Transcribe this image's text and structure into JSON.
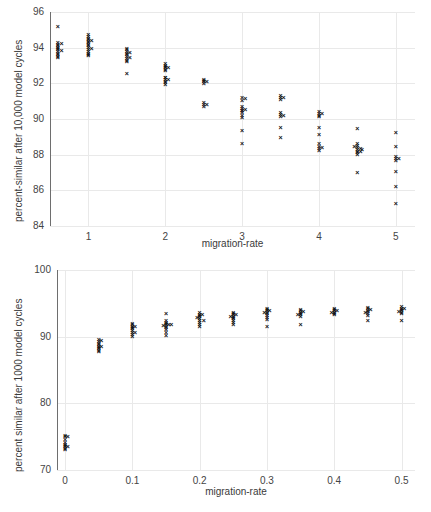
{
  "figure": {
    "background": "#ffffff",
    "marker_color": "#111111",
    "grid_color": "#e9e9e9",
    "axis_color": "#6e6e6e"
  },
  "chart_data": [
    {
      "id": "top",
      "type": "scatter",
      "title": "",
      "xlabel": "migration-rate",
      "ylabel": "percent-similar after 10,000 model cycles",
      "xlim": [
        0.5,
        5.25
      ],
      "ylim": [
        84,
        96
      ],
      "xticks": [
        1,
        2,
        3,
        4,
        5
      ],
      "xticklabels": [
        "1",
        "2",
        "3",
        "4",
        "5"
      ],
      "yticks": [
        84,
        86,
        88,
        90,
        92,
        94,
        96
      ],
      "yticklabels": [
        "84",
        "86",
        "88",
        "90",
        "92",
        "94",
        "96"
      ],
      "grid": true,
      "legend": "none",
      "points": [
        {
          "x": 0.6,
          "y": 95.2
        },
        {
          "x": 0.6,
          "y": 94.3
        },
        {
          "x": 0.6,
          "y": 94.2
        },
        {
          "x": 0.6,
          "y": 94.1
        },
        {
          "x": 0.6,
          "y": 94.0
        },
        {
          "x": 0.6,
          "y": 93.95
        },
        {
          "x": 0.6,
          "y": 93.9
        },
        {
          "x": 0.6,
          "y": 93.8
        },
        {
          "x": 0.6,
          "y": 93.7
        },
        {
          "x": 0.6,
          "y": 93.6
        },
        {
          "x": 0.6,
          "y": 93.5
        },
        {
          "x": 0.6,
          "y": 93.45
        },
        {
          "x": 0.65,
          "y": 94.25
        },
        {
          "x": 0.65,
          "y": 93.85
        },
        {
          "x": 1.0,
          "y": 94.75
        },
        {
          "x": 1.0,
          "y": 94.6
        },
        {
          "x": 1.0,
          "y": 94.5
        },
        {
          "x": 1.0,
          "y": 94.45
        },
        {
          "x": 1.0,
          "y": 94.35
        },
        {
          "x": 1.0,
          "y": 94.3
        },
        {
          "x": 1.0,
          "y": 94.2
        },
        {
          "x": 1.0,
          "y": 94.1
        },
        {
          "x": 1.0,
          "y": 94.0
        },
        {
          "x": 1.0,
          "y": 93.9
        },
        {
          "x": 1.0,
          "y": 93.8
        },
        {
          "x": 1.0,
          "y": 93.7
        },
        {
          "x": 1.0,
          "y": 93.6
        },
        {
          "x": 1.0,
          "y": 93.55
        },
        {
          "x": 1.04,
          "y": 94.4
        },
        {
          "x": 1.04,
          "y": 93.95
        },
        {
          "x": 1.5,
          "y": 93.95
        },
        {
          "x": 1.5,
          "y": 93.9
        },
        {
          "x": 1.5,
          "y": 93.8
        },
        {
          "x": 1.5,
          "y": 93.7
        },
        {
          "x": 1.5,
          "y": 93.6
        },
        {
          "x": 1.5,
          "y": 93.5
        },
        {
          "x": 1.5,
          "y": 93.4
        },
        {
          "x": 1.5,
          "y": 93.3
        },
        {
          "x": 1.5,
          "y": 93.25
        },
        {
          "x": 1.54,
          "y": 93.75
        },
        {
          "x": 1.54,
          "y": 93.45
        },
        {
          "x": 1.5,
          "y": 92.55
        },
        {
          "x": 2.0,
          "y": 93.1
        },
        {
          "x": 2.0,
          "y": 93.0
        },
        {
          "x": 2.0,
          "y": 92.95
        },
        {
          "x": 2.0,
          "y": 92.9
        },
        {
          "x": 2.0,
          "y": 92.8
        },
        {
          "x": 2.0,
          "y": 92.7
        },
        {
          "x": 2.0,
          "y": 92.35
        },
        {
          "x": 2.0,
          "y": 92.3
        },
        {
          "x": 2.0,
          "y": 92.2
        },
        {
          "x": 2.0,
          "y": 92.1
        },
        {
          "x": 2.0,
          "y": 92.05
        },
        {
          "x": 2.0,
          "y": 91.95
        },
        {
          "x": 2.04,
          "y": 92.9
        },
        {
          "x": 2.04,
          "y": 92.2
        },
        {
          "x": 2.5,
          "y": 92.2
        },
        {
          "x": 2.5,
          "y": 92.15
        },
        {
          "x": 2.5,
          "y": 92.1
        },
        {
          "x": 2.5,
          "y": 92.0
        },
        {
          "x": 2.54,
          "y": 92.1
        },
        {
          "x": 2.5,
          "y": 90.9
        },
        {
          "x": 2.5,
          "y": 90.8
        },
        {
          "x": 2.5,
          "y": 90.7
        },
        {
          "x": 2.54,
          "y": 90.8
        },
        {
          "x": 3.0,
          "y": 91.2
        },
        {
          "x": 3.0,
          "y": 91.05
        },
        {
          "x": 3.0,
          "y": 90.7
        },
        {
          "x": 3.0,
          "y": 90.6
        },
        {
          "x": 3.0,
          "y": 90.5
        },
        {
          "x": 3.0,
          "y": 90.45
        },
        {
          "x": 3.0,
          "y": 90.35
        },
        {
          "x": 3.0,
          "y": 90.2
        },
        {
          "x": 3.0,
          "y": 90.1
        },
        {
          "x": 3.04,
          "y": 90.55
        },
        {
          "x": 3.04,
          "y": 91.15
        },
        {
          "x": 3.0,
          "y": 89.35
        },
        {
          "x": 3.0,
          "y": 88.65
        },
        {
          "x": 3.5,
          "y": 91.3
        },
        {
          "x": 3.5,
          "y": 91.2
        },
        {
          "x": 3.5,
          "y": 91.1
        },
        {
          "x": 3.54,
          "y": 91.2
        },
        {
          "x": 3.5,
          "y": 90.35
        },
        {
          "x": 3.5,
          "y": 90.25
        },
        {
          "x": 3.5,
          "y": 90.15
        },
        {
          "x": 3.54,
          "y": 90.2
        },
        {
          "x": 3.5,
          "y": 89.55
        },
        {
          "x": 3.5,
          "y": 88.95
        },
        {
          "x": 4.0,
          "y": 90.4
        },
        {
          "x": 4.0,
          "y": 90.3
        },
        {
          "x": 4.0,
          "y": 90.2
        },
        {
          "x": 4.0,
          "y": 90.15
        },
        {
          "x": 4.04,
          "y": 90.3
        },
        {
          "x": 4.0,
          "y": 89.55
        },
        {
          "x": 4.0,
          "y": 89.15
        },
        {
          "x": 4.0,
          "y": 88.6
        },
        {
          "x": 4.0,
          "y": 88.45
        },
        {
          "x": 4.0,
          "y": 88.35
        },
        {
          "x": 4.0,
          "y": 88.25
        },
        {
          "x": 4.04,
          "y": 88.4
        },
        {
          "x": 4.5,
          "y": 89.45
        },
        {
          "x": 4.5,
          "y": 88.6
        },
        {
          "x": 4.5,
          "y": 88.5
        },
        {
          "x": 4.5,
          "y": 88.4
        },
        {
          "x": 4.5,
          "y": 88.3
        },
        {
          "x": 4.5,
          "y": 88.2
        },
        {
          "x": 4.5,
          "y": 88.1
        },
        {
          "x": 4.5,
          "y": 88.0
        },
        {
          "x": 4.54,
          "y": 88.35
        },
        {
          "x": 4.54,
          "y": 88.15
        },
        {
          "x": 4.46,
          "y": 88.45
        },
        {
          "x": 4.56,
          "y": 88.3
        },
        {
          "x": 4.5,
          "y": 87.0
        },
        {
          "x": 5.0,
          "y": 89.25
        },
        {
          "x": 5.0,
          "y": 88.45
        },
        {
          "x": 5.0,
          "y": 87.9
        },
        {
          "x": 5.0,
          "y": 87.8
        },
        {
          "x": 5.0,
          "y": 87.7
        },
        {
          "x": 5.04,
          "y": 87.8
        },
        {
          "x": 5.0,
          "y": 87.05
        },
        {
          "x": 5.0,
          "y": 86.2
        },
        {
          "x": 5.0,
          "y": 85.25
        }
      ]
    },
    {
      "id": "bottom",
      "type": "scatter",
      "title": "",
      "xlabel": "migration-rate",
      "ylabel": "percent similar after 1000 model cycles",
      "xlim": [
        -0.012,
        0.52
      ],
      "ylim": [
        70,
        100
      ],
      "xticks": [
        0,
        0.1,
        0.2,
        0.3,
        0.4,
        0.5
      ],
      "xticklabels": [
        "0",
        "0.1",
        "0.2",
        "0.3",
        "0.4",
        "0.5"
      ],
      "yticks": [
        70,
        80,
        90,
        100
      ],
      "yticklabels": [
        "70",
        "80",
        "90",
        "100"
      ],
      "grid": true,
      "legend": "none",
      "points": [
        {
          "x": 0.0,
          "y": 75.2
        },
        {
          "x": 0.0,
          "y": 75.0
        },
        {
          "x": 0.0,
          "y": 74.6
        },
        {
          "x": 0.0,
          "y": 74.2
        },
        {
          "x": 0.0,
          "y": 73.9
        },
        {
          "x": 0.0,
          "y": 73.7
        },
        {
          "x": 0.0,
          "y": 73.5
        },
        {
          "x": 0.0,
          "y": 73.3
        },
        {
          "x": 0.0,
          "y": 73.1
        },
        {
          "x": 0.004,
          "y": 75.1
        },
        {
          "x": 0.004,
          "y": 73.6
        },
        {
          "x": 0.05,
          "y": 89.6
        },
        {
          "x": 0.05,
          "y": 89.3
        },
        {
          "x": 0.05,
          "y": 89.0
        },
        {
          "x": 0.05,
          "y": 88.8
        },
        {
          "x": 0.05,
          "y": 88.6
        },
        {
          "x": 0.05,
          "y": 88.4
        },
        {
          "x": 0.05,
          "y": 88.2
        },
        {
          "x": 0.05,
          "y": 88.0
        },
        {
          "x": 0.05,
          "y": 87.8
        },
        {
          "x": 0.054,
          "y": 89.4
        },
        {
          "x": 0.054,
          "y": 88.5
        },
        {
          "x": 0.1,
          "y": 92.0
        },
        {
          "x": 0.1,
          "y": 91.8
        },
        {
          "x": 0.1,
          "y": 91.6
        },
        {
          "x": 0.1,
          "y": 91.4
        },
        {
          "x": 0.1,
          "y": 91.2
        },
        {
          "x": 0.1,
          "y": 91.0
        },
        {
          "x": 0.1,
          "y": 90.7
        },
        {
          "x": 0.1,
          "y": 90.3
        },
        {
          "x": 0.1,
          "y": 90.0
        },
        {
          "x": 0.104,
          "y": 91.5
        },
        {
          "x": 0.104,
          "y": 90.6
        },
        {
          "x": 0.15,
          "y": 93.5
        },
        {
          "x": 0.15,
          "y": 92.4
        },
        {
          "x": 0.15,
          "y": 92.2
        },
        {
          "x": 0.15,
          "y": 92.0
        },
        {
          "x": 0.15,
          "y": 91.8
        },
        {
          "x": 0.15,
          "y": 91.6
        },
        {
          "x": 0.15,
          "y": 91.4
        },
        {
          "x": 0.15,
          "y": 91.1
        },
        {
          "x": 0.15,
          "y": 90.7
        },
        {
          "x": 0.15,
          "y": 90.2
        },
        {
          "x": 0.154,
          "y": 91.9
        },
        {
          "x": 0.146,
          "y": 91.7
        },
        {
          "x": 0.158,
          "y": 91.8
        },
        {
          "x": 0.2,
          "y": 93.6
        },
        {
          "x": 0.2,
          "y": 93.4
        },
        {
          "x": 0.2,
          "y": 93.2
        },
        {
          "x": 0.2,
          "y": 93.0
        },
        {
          "x": 0.2,
          "y": 92.8
        },
        {
          "x": 0.2,
          "y": 92.5
        },
        {
          "x": 0.2,
          "y": 92.2
        },
        {
          "x": 0.2,
          "y": 91.9
        },
        {
          "x": 0.2,
          "y": 91.6
        },
        {
          "x": 0.204,
          "y": 93.3
        },
        {
          "x": 0.196,
          "y": 92.9
        },
        {
          "x": 0.206,
          "y": 92.4
        },
        {
          "x": 0.25,
          "y": 93.7
        },
        {
          "x": 0.25,
          "y": 93.5
        },
        {
          "x": 0.25,
          "y": 93.3
        },
        {
          "x": 0.25,
          "y": 93.1
        },
        {
          "x": 0.25,
          "y": 92.9
        },
        {
          "x": 0.25,
          "y": 92.7
        },
        {
          "x": 0.25,
          "y": 92.5
        },
        {
          "x": 0.25,
          "y": 92.2
        },
        {
          "x": 0.25,
          "y": 91.9
        },
        {
          "x": 0.254,
          "y": 93.4
        },
        {
          "x": 0.246,
          "y": 93.0
        },
        {
          "x": 0.3,
          "y": 94.3
        },
        {
          "x": 0.3,
          "y": 94.1
        },
        {
          "x": 0.3,
          "y": 93.9
        },
        {
          "x": 0.3,
          "y": 93.7
        },
        {
          "x": 0.3,
          "y": 93.5
        },
        {
          "x": 0.3,
          "y": 93.2
        },
        {
          "x": 0.3,
          "y": 92.9
        },
        {
          "x": 0.3,
          "y": 92.6
        },
        {
          "x": 0.304,
          "y": 94.0
        },
        {
          "x": 0.296,
          "y": 93.6
        },
        {
          "x": 0.3,
          "y": 91.6
        },
        {
          "x": 0.35,
          "y": 94.1
        },
        {
          "x": 0.35,
          "y": 93.9
        },
        {
          "x": 0.35,
          "y": 93.7
        },
        {
          "x": 0.35,
          "y": 93.5
        },
        {
          "x": 0.35,
          "y": 93.3
        },
        {
          "x": 0.35,
          "y": 93.0
        },
        {
          "x": 0.354,
          "y": 93.8
        },
        {
          "x": 0.346,
          "y": 93.4
        },
        {
          "x": 0.35,
          "y": 91.9
        },
        {
          "x": 0.4,
          "y": 94.3
        },
        {
          "x": 0.4,
          "y": 94.1
        },
        {
          "x": 0.4,
          "y": 93.9
        },
        {
          "x": 0.4,
          "y": 93.7
        },
        {
          "x": 0.4,
          "y": 93.5
        },
        {
          "x": 0.4,
          "y": 93.3
        },
        {
          "x": 0.404,
          "y": 94.0
        },
        {
          "x": 0.396,
          "y": 93.6
        },
        {
          "x": 0.45,
          "y": 94.4
        },
        {
          "x": 0.45,
          "y": 94.2
        },
        {
          "x": 0.45,
          "y": 94.0
        },
        {
          "x": 0.45,
          "y": 93.8
        },
        {
          "x": 0.45,
          "y": 93.5
        },
        {
          "x": 0.45,
          "y": 93.2
        },
        {
          "x": 0.454,
          "y": 94.1
        },
        {
          "x": 0.446,
          "y": 93.7
        },
        {
          "x": 0.45,
          "y": 92.4
        },
        {
          "x": 0.5,
          "y": 94.5
        },
        {
          "x": 0.5,
          "y": 94.3
        },
        {
          "x": 0.5,
          "y": 94.1
        },
        {
          "x": 0.5,
          "y": 93.9
        },
        {
          "x": 0.5,
          "y": 93.7
        },
        {
          "x": 0.5,
          "y": 93.5
        },
        {
          "x": 0.504,
          "y": 94.2
        },
        {
          "x": 0.496,
          "y": 93.8
        },
        {
          "x": 0.5,
          "y": 92.4
        }
      ]
    }
  ]
}
